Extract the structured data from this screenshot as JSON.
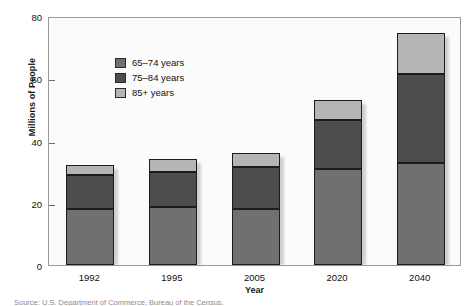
{
  "chart_data": {
    "type": "bar",
    "subtype": "stacked",
    "title": "",
    "xlabel": "Year",
    "ylabel": "Millions of People",
    "categories": [
      "1992",
      "1995",
      "2005",
      "2020",
      "2040"
    ],
    "ylim": [
      0,
      80
    ],
    "yticks": [
      0,
      20,
      40,
      60,
      80
    ],
    "ytick_labels": [
      "0",
      "20",
      "40",
      "60",
      "80"
    ],
    "grid": false,
    "legend_position": "upper-left-inside",
    "series": [
      {
        "name": "65–74 years",
        "color": "#707070",
        "values": [
          18.0,
          18.5,
          18.0,
          31.0,
          32.8
        ]
      },
      {
        "name": "75–84 years",
        "color": "#4d4d4d",
        "values": [
          11.0,
          11.5,
          13.5,
          15.5,
          28.7
        ]
      },
      {
        "name": "85+ years",
        "color": "#b5b5b5",
        "values": [
          3.0,
          4.0,
          4.5,
          6.5,
          13.0
        ]
      }
    ],
    "totals": [
      32.0,
      34.0,
      36.0,
      53.0,
      74.5
    ],
    "source": "Source: U.S. Department of Commerce, Bureau of the Census."
  },
  "colors": {
    "series_65_74": "#707070",
    "series_75_84": "#4d4d4d",
    "series_85_plus": "#b5b5b5",
    "plot_background": "#fbfbfb",
    "frame": "#9a9a9a",
    "text": "#111111"
  }
}
